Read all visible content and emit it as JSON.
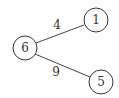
{
  "diagram": {
    "type": "weighted-graph",
    "nodes": [
      {
        "id": "6",
        "label": "6",
        "cx": 25,
        "cy": 48,
        "r": 12
      },
      {
        "id": "1",
        "label": "1",
        "cx": 96,
        "cy": 20,
        "r": 12
      },
      {
        "id": "5",
        "label": "5",
        "cx": 101,
        "cy": 82,
        "r": 12
      }
    ],
    "edges": [
      {
        "from": "6",
        "to": "1",
        "weight": "4"
      },
      {
        "from": "6",
        "to": "5",
        "weight": "9"
      }
    ]
  }
}
